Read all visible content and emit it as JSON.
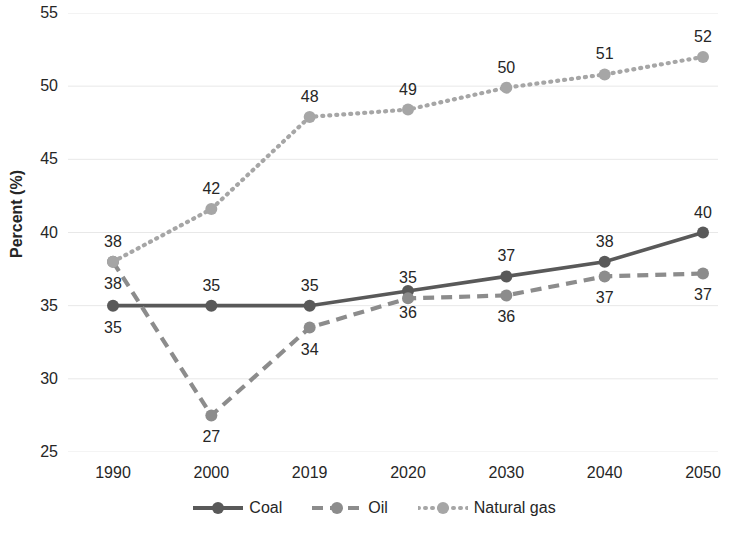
{
  "chart_data": {
    "type": "line",
    "title": "",
    "xlabel": "",
    "ylabel": "Percent (%)",
    "categories": [
      "1990",
      "2000",
      "2019",
      "2020",
      "2030",
      "2040",
      "2050"
    ],
    "ylim": [
      25,
      55
    ],
    "yticks": [
      "25",
      "30",
      "35",
      "40",
      "45",
      "50",
      "55"
    ],
    "ytick_values": [
      25,
      30,
      35,
      40,
      45,
      50,
      55
    ],
    "grid": true,
    "legend_position": "bottom",
    "series": [
      {
        "name": "Coal",
        "color": "#595959",
        "style": "solid",
        "values": [
          35,
          35,
          35,
          36,
          37,
          38,
          40
        ],
        "labels": [
          "35",
          "35",
          "35",
          "36",
          "37",
          "38",
          "40"
        ],
        "label_side": [
          "below",
          "above",
          "above",
          "below",
          "above",
          "above",
          "above"
        ]
      },
      {
        "name": "Oil",
        "color": "#8c8c8c",
        "style": "dashed",
        "values": [
          38,
          27.5,
          33.5,
          35.5,
          35.7,
          37,
          37.2
        ],
        "labels": [
          "38",
          "27",
          "34",
          "35",
          "36",
          "37",
          "37"
        ],
        "label_side": [
          "below",
          "below",
          "below",
          "above",
          "below",
          "below",
          "below"
        ]
      },
      {
        "name": "Natural gas",
        "color": "#a6a6a6",
        "style": "dotted",
        "values": [
          38,
          41.6,
          47.9,
          48.4,
          49.9,
          50.8,
          52
        ],
        "labels": [
          "38",
          "42",
          "48",
          "49",
          "50",
          "51",
          "52"
        ],
        "label_side": [
          "above",
          "above",
          "above",
          "above",
          "above",
          "above",
          "above"
        ]
      }
    ]
  },
  "legend": {
    "items": [
      {
        "label": "Coal",
        "color": "#595959",
        "style": "solid"
      },
      {
        "label": "Oil",
        "color": "#8c8c8c",
        "style": "dashed"
      },
      {
        "label": "Natural gas",
        "color": "#a6a6a6",
        "style": "dotted"
      }
    ]
  }
}
